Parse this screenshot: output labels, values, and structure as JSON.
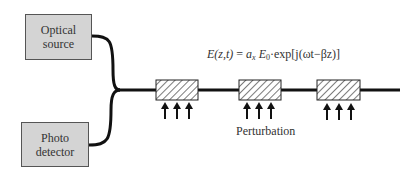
{
  "diagram": {
    "optical_source": {
      "line1": "Optical",
      "line2": "source"
    },
    "photo_detector": {
      "line1": "Photo",
      "line2": "detector"
    },
    "equation": {
      "lhs": "E(z,t)",
      "eq": " = ",
      "ax": "a",
      "ax_sub": "x",
      "e0": "E",
      "e0_sub": "0",
      "rhs": "·exp[j(ωt−βz)]"
    },
    "perturbation_label": "Perturbation",
    "gratings": [
      {
        "x": 156,
        "y": 80,
        "w": 42,
        "h": 20
      },
      {
        "x": 239,
        "y": 80,
        "w": 42,
        "h": 20
      },
      {
        "x": 317,
        "y": 80,
        "w": 43,
        "h": 20
      }
    ],
    "colors": {
      "box_fill": "#d4d4d4",
      "line": "#111111",
      "hatch": "#333333"
    }
  }
}
